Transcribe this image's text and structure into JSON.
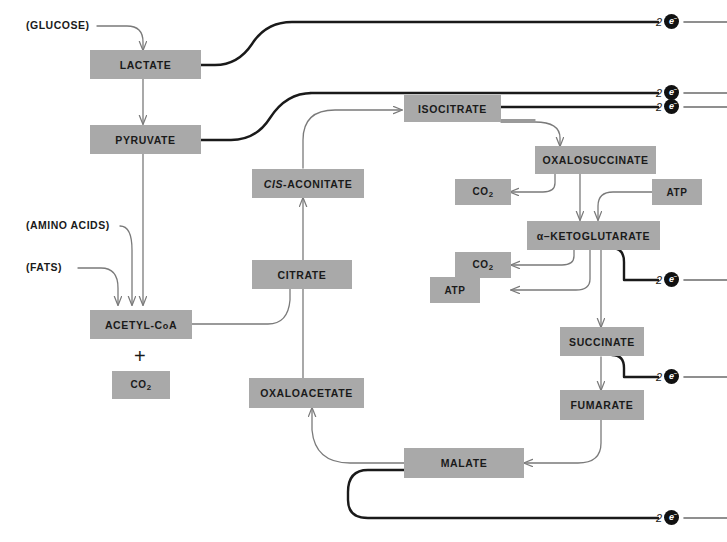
{
  "diagram": {
    "background_color": "#ffffff",
    "node_fill_color": "#a9a9a9",
    "node_text_color": "#1a1a1a",
    "thin_arrow_color": "#7a7a7a",
    "thick_line_color": "#1a1a1a"
  },
  "inputs": [
    {
      "label": "(GLUCOSE)"
    },
    {
      "label": "(AMINO ACIDS)"
    },
    {
      "label": "(FATS)"
    }
  ],
  "nodes": {
    "lactate": {
      "label": "LACTATE"
    },
    "pyruvate": {
      "label": "PYRUVATE"
    },
    "acetyl_coa": {
      "label": "ACETYL-CoA"
    },
    "co2_acetyl": {
      "label": "CO2"
    },
    "cis_aconitate": {
      "label": "CIS-ACONITATE",
      "italic_part": "CIS",
      "rest_part": "-ACONITATE"
    },
    "citrate": {
      "label": "CITRATE"
    },
    "oxaloacetate": {
      "label": "OXALOACETATE"
    },
    "isocitrate": {
      "label": "ISOCITRATE"
    },
    "oxalosuccinate": {
      "label": "OXALOSUCCINATE"
    },
    "alpha_ketoglutarate": {
      "label": "α–KETOGLUTARATE"
    },
    "succinate": {
      "label": "SUCCINATE"
    },
    "fumarate": {
      "label": "FUMARATE"
    },
    "malate": {
      "label": "MALATE"
    },
    "co2_oxalosuccinate": {
      "label": "CO2"
    },
    "atp_oxalosuccinate": {
      "label": "ATP"
    },
    "co2_ketoglutarate": {
      "label": "CO2"
    },
    "atp_ketoglutarate": {
      "label": "ATP"
    }
  },
  "plus_sign": "+",
  "electron_outputs": [
    {
      "id": "e-lactate",
      "count": "2",
      "symbol": "e",
      "charge": "–",
      "source": "LACTATE"
    },
    {
      "id": "e-pyruvate",
      "count": "2",
      "symbol": "e",
      "charge": "–",
      "source": "PYRUVATE"
    },
    {
      "id": "e-isocitrate",
      "count": "2",
      "symbol": "e",
      "charge": "–",
      "source": "ISOCITRATE"
    },
    {
      "id": "e-ketoglutarate",
      "count": "2",
      "symbol": "e",
      "charge": "–",
      "source": "α-KETOGLUTARATE"
    },
    {
      "id": "e-succinate",
      "count": "2",
      "symbol": "e",
      "charge": "–",
      "source": "SUCCINATE"
    },
    {
      "id": "e-malate",
      "count": "2",
      "symbol": "e",
      "charge": "–",
      "source": "MALATE"
    }
  ]
}
